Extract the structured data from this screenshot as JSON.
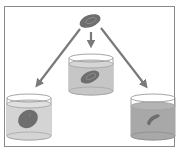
{
  "diagram": {
    "colors": {
      "frame": "#8a8a8a",
      "arrow": "#7a7a7a",
      "cell": "#6e6e6e",
      "cell_highlight": "#8c8c8c",
      "beaker_outline": "#9a9a9a",
      "solution_light": "#d4d4d4",
      "solution_mid": "#c6c6c6",
      "solution_dark": "#a8a8a8"
    },
    "source_cell": {
      "shape": "biconcave disc"
    },
    "beakers": [
      {
        "position": "left",
        "cell_state": "swollen",
        "solution_shade": "light"
      },
      {
        "position": "center",
        "cell_state": "normal",
        "solution_shade": "medium"
      },
      {
        "position": "right",
        "cell_state": "shriveled",
        "solution_shade": "dark"
      }
    ]
  }
}
